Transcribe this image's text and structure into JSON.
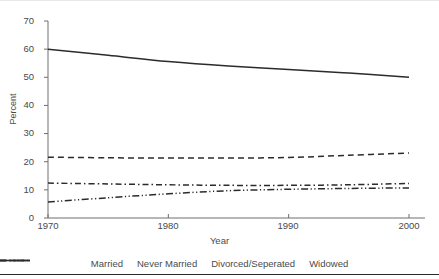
{
  "chart_data": {
    "type": "line",
    "title": "",
    "xlabel": "Year",
    "ylabel": "Percent",
    "xlim": [
      1970,
      2000
    ],
    "ylim": [
      0,
      70
    ],
    "ytick_labels": [
      "0",
      "10",
      "20",
      "30",
      "40",
      "50",
      "60",
      "70"
    ],
    "ytick_values": [
      0,
      10,
      20,
      30,
      40,
      50,
      60,
      70
    ],
    "xtick_labels": [
      "1970",
      "1980",
      "1990",
      "2000"
    ],
    "xtick_values": [
      1970,
      1980,
      1990,
      2000
    ],
    "grid": false,
    "legend_position": "bottom",
    "x": [
      1970,
      1975,
      1980,
      1985,
      1990,
      1995,
      2000
    ],
    "series": [
      {
        "name": "Married",
        "style": "solid",
        "color": "#2b2b2b",
        "values": [
          60.0,
          57.8,
          55.6,
          54.0,
          52.8,
          51.5,
          50.0
        ]
      },
      {
        "name": "Never Married",
        "style": "dashed",
        "color": "#2b2b2b",
        "values": [
          21.6,
          21.4,
          21.3,
          21.3,
          21.5,
          22.3,
          23.1
        ]
      },
      {
        "name": "Divorced/Seperated",
        "style": "dash-dot",
        "color": "#2b2b2b",
        "values": [
          12.4,
          12.1,
          11.8,
          11.6,
          11.6,
          11.8,
          12.3
        ]
      },
      {
        "name": "Widowed",
        "style": "dash-dot-dot",
        "color": "#2b2b2b",
        "values": [
          5.7,
          7.2,
          8.6,
          9.7,
          10.2,
          10.5,
          10.7
        ]
      }
    ]
  },
  "axes": {
    "y_axis_label": "Percent",
    "x_axis_label": "Year"
  },
  "legend": {
    "items": [
      {
        "label": "Married",
        "key": "solid-line-key"
      },
      {
        "label": "Never Married",
        "key": "dashed-line-key"
      },
      {
        "label": "Divorced/Seperated",
        "key": "dash-dot-line-key"
      },
      {
        "label": "Widowed",
        "key": "dash-dot-dot-line-key"
      }
    ]
  },
  "clipped_header": {
    "text": " "
  }
}
